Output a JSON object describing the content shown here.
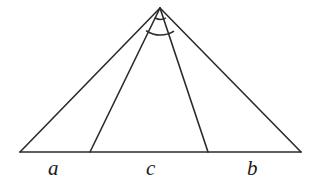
{
  "figure": {
    "kind": "geometry-diagram",
    "background_color": "#ffffff",
    "stroke_color": "#2b2b2b",
    "label_color": "#1a1a1a",
    "canvas": {
      "width": 317,
      "height": 184
    },
    "points": {
      "apex": {
        "name": "apex",
        "x": 160,
        "y": 8
      },
      "base_left": {
        "name": "base-left",
        "x": 20,
        "y": 152
      },
      "base_right": {
        "name": "base-right",
        "x": 301,
        "y": 152
      },
      "cevian_foot_left": {
        "name": "cevian-foot-left",
        "x": 90,
        "y": 152
      },
      "cevian_foot_right": {
        "name": "cevian-foot-right",
        "x": 208,
        "y": 152
      }
    },
    "segments": [
      {
        "name": "left-side",
        "from": "apex",
        "to": "base_left"
      },
      {
        "name": "right-side",
        "from": "apex",
        "to": "base_right"
      },
      {
        "name": "base-line",
        "from": "base_left",
        "to": "base_right"
      },
      {
        "name": "left-cevian",
        "from": "apex",
        "to": "cevian_foot_left"
      },
      {
        "name": "right-cevian",
        "from": "apex",
        "to": "cevian_foot_right"
      }
    ],
    "arcs": [
      {
        "name": "inner-angle-arc",
        "radius": 10,
        "note": "small arc at apex between the two cevians"
      },
      {
        "name": "outer-angle-arc",
        "radius": 24,
        "note": "wider arc at apex spanning the cevians"
      }
    ],
    "labels": [
      {
        "name": "segment-label-a",
        "text": "a",
        "x": 55,
        "y": 175,
        "segment": "base_left to cevian_foot_left"
      },
      {
        "name": "segment-label-c",
        "text": "c",
        "x": 152,
        "y": 175,
        "segment": "cevian_foot_left to cevian_foot_right"
      },
      {
        "name": "segment-label-b",
        "text": "b",
        "x": 253,
        "y": 175,
        "segment": "cevian_foot_right to base_right"
      }
    ]
  }
}
